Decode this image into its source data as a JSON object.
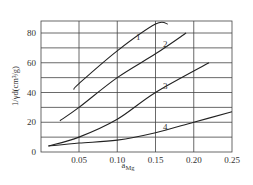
{
  "chart_data": {
    "type": "line",
    "title": "",
    "xlabel": "a_Mg",
    "ylabel": "1/γ_d(cm³/g)",
    "xlim": [
      0.0,
      0.25
    ],
    "ylim": [
      0,
      86
    ],
    "xticks": [
      "0.05",
      "0.10",
      "0.15",
      "0.20",
      "0.25"
    ],
    "yticks": [
      "0",
      "20",
      "40",
      "60",
      "80"
    ],
    "grid": true,
    "legend": "inline curve labels",
    "series": [
      {
        "name": "1",
        "x": [
          0.043,
          0.05,
          0.1,
          0.15,
          0.166
        ],
        "y": [
          42,
          46,
          68,
          86,
          86
        ]
      },
      {
        "name": "2",
        "x": [
          0.025,
          0.05,
          0.1,
          0.15,
          0.19
        ],
        "y": [
          21,
          30,
          50,
          66,
          80
        ]
      },
      {
        "name": "3",
        "x": [
          0.01,
          0.05,
          0.1,
          0.15,
          0.22
        ],
        "y": [
          4,
          10,
          22,
          40,
          60
        ]
      },
      {
        "name": "4",
        "x": [
          0.01,
          0.05,
          0.1,
          0.15,
          0.2,
          0.25
        ],
        "y": [
          4,
          6,
          8,
          13,
          20,
          27
        ]
      }
    ]
  },
  "axes": {
    "x_label_main": "a",
    "x_label_sub": "Mg",
    "y_label": "1/γd(cm³/g)"
  },
  "curve_labels": [
    "1",
    "2",
    "3",
    "4"
  ]
}
